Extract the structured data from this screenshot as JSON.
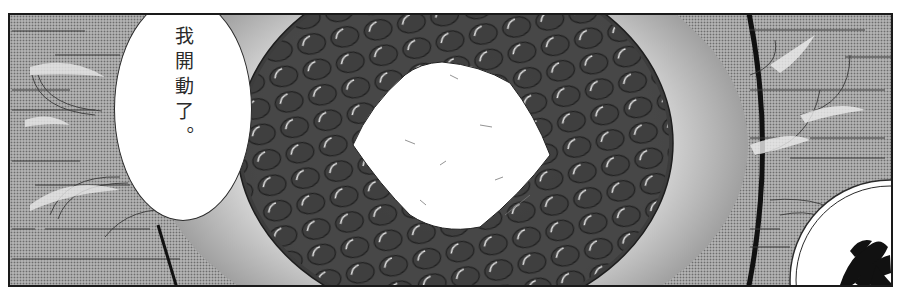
{
  "panel": {
    "type": "manga-panel",
    "description": "Bowl of glossy black beans with a white square of tofu in the center, viewed from above",
    "background": "screentone with horizontal speed lines and wind/steam wisps"
  },
  "speech_bubble": {
    "text": "我開動了。",
    "orientation": "vertical"
  },
  "bowl": {
    "contents": "black beans",
    "topping": "tofu"
  },
  "plate_corner": {
    "glyph": "calligraphy brush character (partially visible)"
  },
  "colors": {
    "ink": "#1a1a1a",
    "screentone": "#a9a9a9",
    "bowl_fill": "#4a4a4a",
    "bean_highlight": "#f2f2f2",
    "tofu": "#ffffff",
    "bubble": "#ffffff"
  }
}
